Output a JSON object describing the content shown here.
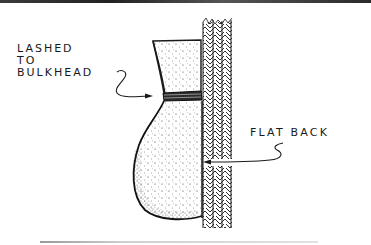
{
  "figure": {
    "callouts": [
      {
        "id": "lashed",
        "lines": [
          "LASHED",
          "TO",
          "BULKHEAD"
        ]
      },
      {
        "id": "flat-back",
        "lines": [
          "FLAT BACK"
        ]
      }
    ],
    "components": [
      "vessel-neck",
      "lashing",
      "vessel-bulb",
      "bulkhead-wall"
    ]
  },
  "colors": {
    "ink": "#1a1a1a",
    "paper": "#ffffff",
    "top_band": "#2a2a2a",
    "bottom_rule": "#c8c8c8"
  }
}
